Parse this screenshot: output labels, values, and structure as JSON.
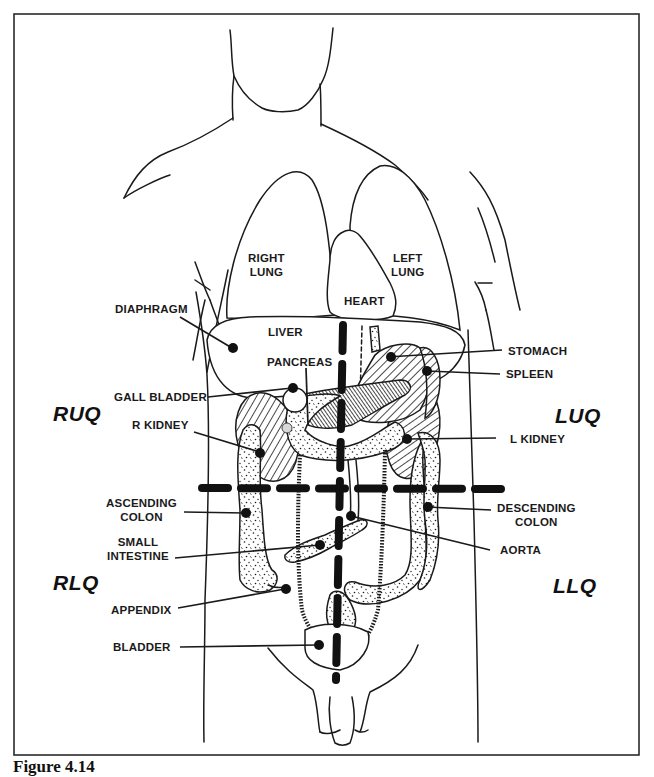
{
  "figure": {
    "caption": "Figure 4.14",
    "frame_color": "#2a2a2a",
    "ink_color": "#1a1a1a"
  },
  "quadrants": {
    "ruq": "RUQ",
    "luq": "LUQ",
    "rlq": "RLQ",
    "llq": "LLQ"
  },
  "labels": {
    "right_lung": "RIGHT\nLUNG",
    "left_lung": "LEFT\nLUNG",
    "heart": "HEART",
    "diaphragm": "DIAPHRAGM",
    "liver": "LIVER",
    "pancreas": "PANCREAS",
    "gall_bladder": "GALL BLADDER",
    "r_kidney": "R KIDNEY",
    "stomach": "STOMACH",
    "spleen": "SPLEEN",
    "l_kidney": "L KIDNEY",
    "ascending_colon": "ASCENDING\nCOLON",
    "descending_colon": "DESCENDING\nCOLON",
    "small_intestine": "SMALL\nINTESTINE",
    "aorta": "AORTA",
    "appendix": "APPENDIX",
    "bladder": "BLADDER"
  },
  "structure": {
    "regions": [
      "RUQ",
      "LUQ",
      "RLQ",
      "LLQ"
    ],
    "dividers": [
      "vertical midline (dashed)",
      "horizontal umbilical line (dashed)"
    ],
    "organs": [
      {
        "name": "Right Lung",
        "region": "thorax"
      },
      {
        "name": "Left Lung",
        "region": "thorax"
      },
      {
        "name": "Heart",
        "region": "thorax"
      },
      {
        "name": "Diaphragm",
        "region": "RUQ"
      },
      {
        "name": "Liver",
        "region": "RUQ"
      },
      {
        "name": "Pancreas",
        "region": "RUQ/LUQ"
      },
      {
        "name": "Gall Bladder",
        "region": "RUQ"
      },
      {
        "name": "R Kidney",
        "region": "RUQ"
      },
      {
        "name": "Stomach",
        "region": "LUQ"
      },
      {
        "name": "Spleen",
        "region": "LUQ"
      },
      {
        "name": "L Kidney",
        "region": "LUQ"
      },
      {
        "name": "Ascending Colon",
        "region": "RLQ"
      },
      {
        "name": "Small Intestine",
        "region": "RLQ"
      },
      {
        "name": "Appendix",
        "region": "RLQ"
      },
      {
        "name": "Bladder",
        "region": "midline pelvis"
      },
      {
        "name": "Descending Colon",
        "region": "LLQ"
      },
      {
        "name": "Aorta",
        "region": "midline"
      }
    ]
  }
}
